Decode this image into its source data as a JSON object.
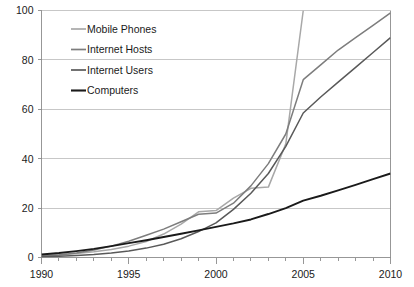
{
  "chart_data": {
    "type": "line",
    "title": "",
    "subtitle": "",
    "xlabel": "",
    "ylabel": "",
    "xlim": [
      1990,
      2010
    ],
    "ylim": [
      0,
      100
    ],
    "grid": true,
    "legend_position": "top-left-inside",
    "x_major_ticks": [
      1990,
      1995,
      2000,
      2005,
      2010
    ],
    "x_major_tick_labels": [
      "1990",
      "1995",
      "2000",
      "2005",
      "2010"
    ],
    "x_minor_tick_step": 1,
    "y_ticks": [
      0,
      20,
      40,
      60,
      80,
      100
    ],
    "y_tick_labels": [
      "0",
      "20",
      "40",
      "60",
      "80",
      "100"
    ],
    "x": [
      1990,
      1991,
      1992,
      1993,
      1994,
      1995,
      1996,
      1997,
      1998,
      1999,
      2000,
      2001,
      2002,
      2003,
      2004,
      2005,
      2006,
      2007,
      2008,
      2009,
      2010
    ],
    "series": [
      {
        "name": "Mobile Phones",
        "color": "#a8a8a8",
        "clipped_at_top": true,
        "exits_plot_at_x": 2004,
        "values": [
          0.8,
          1.1,
          1.6,
          2.3,
          3.2,
          4.6,
          6.5,
          9.5,
          13.5,
          18.5,
          19.0,
          24.0,
          28.0,
          28.5,
          46.0,
          100.0,
          null,
          null,
          null,
          null,
          null
        ]
      },
      {
        "name": "Internet Hosts",
        "color": "#7d7d7d",
        "clipped_at_top": false,
        "values": [
          0.5,
          1.0,
          1.8,
          3.0,
          4.6,
          6.6,
          9.0,
          11.5,
          14.5,
          17.5,
          18.0,
          22.0,
          29.0,
          38.0,
          50.0,
          72.0,
          78.0,
          84.0,
          89.0,
          94.0,
          99.0
        ]
      },
      {
        "name": "Internet Users",
        "color": "#595959",
        "clipped_at_top": false,
        "values": [
          0.3,
          0.5,
          0.8,
          1.2,
          1.8,
          2.6,
          3.8,
          5.4,
          7.6,
          10.5,
          14.0,
          19.5,
          26.0,
          34.0,
          45.0,
          58.5,
          65.0,
          71.0,
          77.0,
          83.0,
          89.0
        ]
      },
      {
        "name": "Computers",
        "color": "#1a1a1a",
        "clipped_at_top": false,
        "values": [
          1.2,
          1.8,
          2.6,
          3.5,
          4.6,
          5.8,
          7.0,
          8.3,
          9.6,
          11.0,
          12.4,
          13.8,
          15.4,
          17.6,
          20.0,
          23.0,
          25.0,
          27.2,
          29.4,
          31.7,
          34.0
        ]
      }
    ]
  },
  "legend": {
    "items": [
      {
        "label": "Mobile Phones",
        "color": "#a8a8a8"
      },
      {
        "label": "Internet Hosts",
        "color": "#7d7d7d"
      },
      {
        "label": "Internet Users",
        "color": "#595959"
      },
      {
        "label": "Computers",
        "color": "#1a1a1a"
      }
    ]
  },
  "axes": {
    "y_labels": [
      "100",
      "80",
      "60",
      "40",
      "20",
      "0"
    ],
    "x_labels": [
      "1990",
      "1995",
      "2000",
      "2005",
      "2010"
    ]
  }
}
